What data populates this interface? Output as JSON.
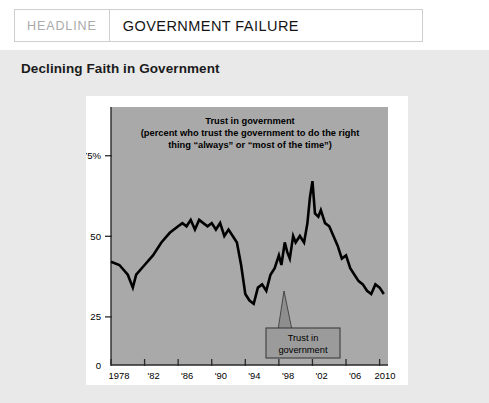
{
  "header": {
    "kicker": "HEADLINE",
    "title": "GOVERNMENT FAILURE"
  },
  "section": {
    "heading": "Declining Faith in Government"
  },
  "colors": {
    "page_background": "#e9e9e9",
    "card_background": "#ffffff",
    "plot_background": "#a9a9a9",
    "line_color": "#000000",
    "callout_fill": "#9b9b9b",
    "kicker_text": "#aaaaaa",
    "title_text": "#141414"
  },
  "chart_data": {
    "type": "line",
    "title": "Trust in government",
    "title_lines": [
      "Trust in government",
      "(percent who trust the government to do the right",
      "thing “always” or “most of the time”)"
    ],
    "xlabel": "",
    "ylabel": "",
    "xlim": [
      1978,
      2011
    ],
    "ylim": [
      0,
      80
    ],
    "grid": false,
    "legend": "none",
    "ytick_labels": [
      "75%",
      "50",
      "25",
      "0"
    ],
    "ytick_values": [
      75,
      50,
      25,
      0
    ],
    "xtick_labels": [
      "1978",
      "'82",
      "'86",
      "'90",
      "'94",
      "'98",
      "'02",
      "'06",
      "2010"
    ],
    "xtick_values": [
      1978,
      1982,
      1986,
      1990,
      1994,
      1998,
      2002,
      2006,
      2010
    ],
    "annotations": [
      {
        "label_lines": [
          "Trust in",
          "government"
        ],
        "label": "Trust in government",
        "points_to_year": 1999,
        "points_to_value": 38
      }
    ],
    "series": [
      {
        "name": "Trust in government",
        "x": [
          1978,
          1979,
          1980,
          1980.6,
          1981,
          1982,
          1983,
          1984,
          1985,
          1986,
          1986.5,
          1987,
          1987.5,
          1988,
          1988.5,
          1989,
          1989.5,
          1990,
          1990.5,
          1991,
          1991.5,
          1992,
          1992.5,
          1993,
          1993.5,
          1994,
          1994.5,
          1995,
          1995.5,
          1996,
          1996.5,
          1997,
          1997.5,
          1998,
          1998.3,
          1998.7,
          1999,
          1999.3,
          1999.7,
          2000,
          2000.5,
          2001,
          2001.4,
          2001.7,
          2002,
          2002.3,
          2002.7,
          2003,
          2003.5,
          2004,
          2004.5,
          2005,
          2005.5,
          2006,
          2006.5,
          2007,
          2007.5,
          2008,
          2008.5,
          2009,
          2009.5,
          2010,
          2010.5
        ],
        "y": [
          32,
          31,
          28,
          24,
          28,
          31,
          34,
          38,
          41,
          43,
          44,
          43,
          45,
          42,
          45,
          44,
          43,
          44,
          42,
          44,
          40,
          42,
          40,
          38,
          31,
          22,
          20,
          19,
          24,
          25,
          23,
          28,
          30,
          34,
          31,
          38,
          35,
          33,
          40,
          38,
          40,
          38,
          44,
          52,
          57,
          47,
          46,
          48,
          44,
          43,
          40,
          37,
          33,
          34,
          30,
          28,
          26,
          25,
          23,
          22,
          25,
          24,
          22
        ],
        "color": "#000000",
        "linewidth": 2.6
      }
    ]
  }
}
